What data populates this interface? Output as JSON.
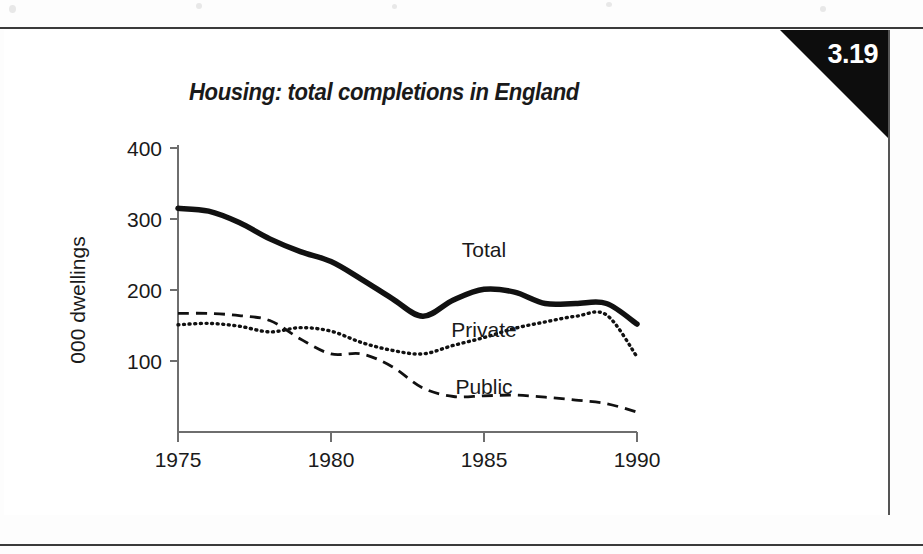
{
  "page": {
    "figure_number": "3.19",
    "background_color": "#ffffff",
    "ink_color": "#111111",
    "rule_color": "#3a3a3a"
  },
  "chart_data": {
    "type": "line",
    "title": "Housing: total completions in England",
    "xlabel": "",
    "ylabel": "000 dwellings",
    "xlim": [
      1975,
      1990
    ],
    "ylim": [
      0,
      400
    ],
    "xticks": [
      "1975",
      "1980",
      "1985",
      "1990"
    ],
    "yticks": [
      "100",
      "200",
      "300",
      "400"
    ],
    "grid": false,
    "legend_position": "inline-annotations",
    "x": [
      1975,
      1976,
      1977,
      1978,
      1979,
      1980,
      1981,
      1982,
      1983,
      1984,
      1985,
      1986,
      1987,
      1988,
      1989,
      1990
    ],
    "series": [
      {
        "name": "Total",
        "style": "solid",
        "label_x": 1985,
        "label_y": 247,
        "values": [
          315,
          311,
          295,
          272,
          254,
          240,
          215,
          188,
          163,
          186,
          201,
          197,
          181,
          181,
          181,
          152
        ]
      },
      {
        "name": "Private",
        "style": "dotted",
        "label_x": 1985,
        "label_y": 134,
        "values": [
          151,
          153,
          149,
          141,
          147,
          142,
          126,
          115,
          110,
          122,
          133,
          146,
          155,
          163,
          165,
          106
        ]
      },
      {
        "name": "Public",
        "style": "dashed",
        "label_x": 1985,
        "label_y": 53,
        "values": [
          167,
          167,
          164,
          157,
          131,
          110,
          110,
          92,
          62,
          50,
          51,
          52,
          49,
          45,
          40,
          28
        ]
      }
    ]
  }
}
